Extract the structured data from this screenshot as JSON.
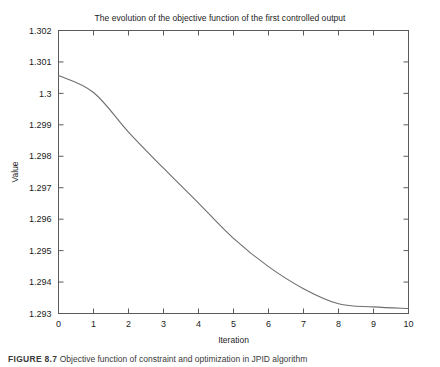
{
  "figure": {
    "caption_label": "FIGURE 8.7",
    "caption_text": "Objective function of constraint and optimization in JPID algorithm"
  },
  "chart_data": {
    "type": "line",
    "title": "The evolution of the objective function of the first controlled output",
    "xlabel": "Iteration",
    "ylabel": "Value",
    "x": [
      0,
      1,
      2,
      3,
      4,
      5,
      6,
      7,
      8,
      9,
      10
    ],
    "values": [
      1.30057,
      1.30003,
      1.29877,
      1.29762,
      1.29651,
      1.29539,
      1.29449,
      1.29379,
      1.29331,
      1.29321,
      1.29316
    ],
    "series": [
      {
        "name": "objective function",
        "values": [
          1.30057,
          1.30003,
          1.29877,
          1.29762,
          1.29651,
          1.29539,
          1.29449,
          1.29379,
          1.29331,
          1.29321,
          1.29316
        ]
      }
    ],
    "xlim": [
      0,
      10
    ],
    "ylim": [
      1.293,
      1.302
    ],
    "xticks": [
      0,
      1,
      2,
      3,
      4,
      5,
      6,
      7,
      8,
      9,
      10
    ],
    "xtick_labels": [
      "0",
      "1",
      "2",
      "3",
      "4",
      "5",
      "6",
      "7",
      "8",
      "9",
      "10"
    ],
    "yticks": [
      1.293,
      1.294,
      1.295,
      1.296,
      1.297,
      1.298,
      1.299,
      1.3,
      1.301,
      1.302
    ],
    "ytick_labels": [
      "1.293",
      "1.294",
      "1.295",
      "1.296",
      "1.297",
      "1.298",
      "1.299",
      "1.3",
      "1.301",
      "1.302"
    ],
    "grid": false,
    "legend": null,
    "line_color": "#6e6e6e",
    "axis_color": "#5a5a5a",
    "background": "#ffffff"
  }
}
